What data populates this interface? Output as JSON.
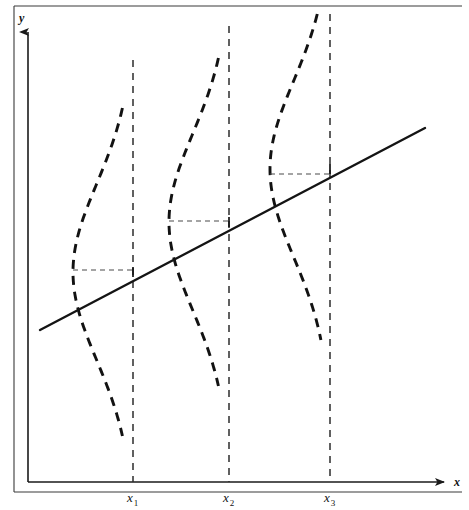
{
  "figure": {
    "caption": "",
    "background_color": "#ffffff",
    "ink_color": "#121212"
  },
  "axes": {
    "y_axis_label": "y",
    "x_axis_label": "x",
    "y_axis_arrow": "arrow-up",
    "x_axis_arrow": "arrow-right",
    "origin_px": [
      28,
      482
    ],
    "y_axis_top_px": [
      28,
      30
    ],
    "x_axis_right_px": [
      450,
      482
    ]
  },
  "tick_labels": [
    {
      "base": "x",
      "sub": "1"
    },
    {
      "base": "x",
      "sub": "2"
    },
    {
      "base": "x",
      "sub": "3"
    }
  ],
  "chart_data": {
    "type": "line",
    "title": "",
    "subtitle": "",
    "xlabel": "x",
    "ylabel": "y",
    "grid": false,
    "legend": "none",
    "xlim": [
      0,
      469
    ],
    "ylim": [
      0,
      510
    ],
    "regression_line": {
      "name": "population regression line",
      "style": "solid",
      "x_start": 40,
      "y_start": 330,
      "x_end": 425,
      "y_end": 128,
      "slope_px": -0.5247,
      "points_on_line": [
        {
          "label": "x1",
          "x": 133,
          "y": 272
        },
        {
          "label": "x2",
          "x": 229,
          "y": 222
        },
        {
          "label": "x3",
          "x": 330,
          "y": 169
        }
      ]
    },
    "distributions": [
      {
        "name": "conditional distribution at x1",
        "center_x": 133,
        "mean_y": 272,
        "spread_y": 88,
        "amplitude_x": 60,
        "top_y": 108,
        "bottom_y": 436,
        "style": "dashed",
        "mean_marker_x": 73,
        "mean_marker_y": 270
      },
      {
        "name": "conditional distribution at x2",
        "center_x": 229,
        "mean_y": 222,
        "spread_y": 88,
        "amplitude_x": 60,
        "top_y": 58,
        "bottom_y": 386,
        "style": "dashed",
        "mean_marker_x": 169,
        "mean_marker_y": 221
      },
      {
        "name": "conditional distribution at x3",
        "center_x": 330,
        "mean_y": 169,
        "spread_y": 88,
        "amplitude_x": 60,
        "top_y": 14,
        "bottom_y": 340,
        "style": "dashed",
        "mean_marker_x": 270,
        "mean_marker_y": 174
      }
    ],
    "vertical_guides": [
      {
        "x": 133,
        "y_top": 60,
        "y_bottom": 482
      },
      {
        "x": 229,
        "y_top": 26,
        "y_bottom": 482
      },
      {
        "x": 330,
        "y_top": 14,
        "y_bottom": 482
      }
    ],
    "horizontal_guides": [
      {
        "y": 270,
        "x_start": 73,
        "x_end": 133
      },
      {
        "y": 221,
        "x_start": 169,
        "x_end": 229
      },
      {
        "y": 174,
        "x_start": 270,
        "x_end": 330
      }
    ]
  }
}
